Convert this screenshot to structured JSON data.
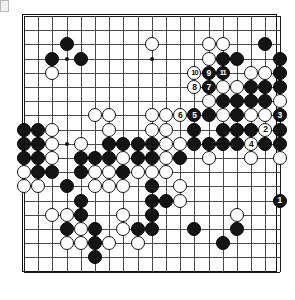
{
  "app": {
    "title": "Go Game Record Diagram",
    "board_size": 19,
    "colors": {
      "board_background": "#ffffff",
      "line": "#4a4a4a",
      "border": "#111111",
      "black_stone": "#141414",
      "white_stone": "#ffffff"
    }
  },
  "board": {
    "size": 19,
    "origin_x": 8,
    "origin_y": 8,
    "spacing": 14.2,
    "hoshi": [
      {
        "col": 4,
        "row": 4
      },
      {
        "col": 10,
        "row": 4
      },
      {
        "col": 16,
        "row": 4
      },
      {
        "col": 4,
        "row": 10
      },
      {
        "col": 10,
        "row": 10
      },
      {
        "col": 16,
        "row": 10
      },
      {
        "col": 4,
        "row": 16
      },
      {
        "col": 10,
        "row": 16
      },
      {
        "col": 16,
        "row": 16
      }
    ],
    "stones": [
      {
        "col": 4,
        "row": 3,
        "color": "black"
      },
      {
        "col": 3,
        "row": 4,
        "color": "black"
      },
      {
        "col": 5,
        "row": 4,
        "color": "black"
      },
      {
        "col": 3,
        "row": 5,
        "color": "white"
      },
      {
        "col": 10,
        "row": 3,
        "color": "white"
      },
      {
        "col": 14,
        "row": 3,
        "color": "white"
      },
      {
        "col": 15,
        "row": 3,
        "color": "white"
      },
      {
        "col": 18,
        "row": 3,
        "color": "black"
      },
      {
        "col": 14,
        "row": 4,
        "color": "white"
      },
      {
        "col": 15,
        "row": 4,
        "color": "black"
      },
      {
        "col": 16,
        "row": 4,
        "color": "black"
      },
      {
        "col": 19,
        "row": 4,
        "color": "black"
      },
      {
        "col": 13,
        "row": 5,
        "color": "white",
        "label": "10"
      },
      {
        "col": 14,
        "row": 5,
        "color": "black",
        "label": "9"
      },
      {
        "col": 15,
        "row": 5,
        "color": "black",
        "label": "11"
      },
      {
        "col": 17,
        "row": 5,
        "color": "white"
      },
      {
        "col": 18,
        "row": 5,
        "color": "white"
      },
      {
        "col": 19,
        "row": 5,
        "color": "black"
      },
      {
        "col": 13,
        "row": 6,
        "color": "white",
        "label": "8"
      },
      {
        "col": 14,
        "row": 6,
        "color": "black",
        "label": "7"
      },
      {
        "col": 15,
        "row": 6,
        "color": "white"
      },
      {
        "col": 16,
        "row": 6,
        "color": "white"
      },
      {
        "col": 17,
        "row": 6,
        "color": "black"
      },
      {
        "col": 18,
        "row": 6,
        "color": "black"
      },
      {
        "col": 19,
        "row": 6,
        "color": "black"
      },
      {
        "col": 14,
        "row": 7,
        "color": "white"
      },
      {
        "col": 15,
        "row": 7,
        "color": "black"
      },
      {
        "col": 16,
        "row": 7,
        "color": "black"
      },
      {
        "col": 17,
        "row": 7,
        "color": "black"
      },
      {
        "col": 18,
        "row": 7,
        "color": "black"
      },
      {
        "col": 19,
        "row": 7,
        "color": "white"
      },
      {
        "col": 6,
        "row": 8,
        "color": "white"
      },
      {
        "col": 7,
        "row": 8,
        "color": "white"
      },
      {
        "col": 10,
        "row": 8,
        "color": "white"
      },
      {
        "col": 11,
        "row": 8,
        "color": "white"
      },
      {
        "col": 12,
        "row": 8,
        "color": "white",
        "label": "6"
      },
      {
        "col": 13,
        "row": 8,
        "color": "black",
        "label": "5"
      },
      {
        "col": 14,
        "row": 8,
        "color": "black"
      },
      {
        "col": 15,
        "row": 8,
        "color": "white"
      },
      {
        "col": 16,
        "row": 8,
        "color": "black"
      },
      {
        "col": 17,
        "row": 8,
        "color": "white"
      },
      {
        "col": 18,
        "row": 8,
        "color": "white"
      },
      {
        "col": 19,
        "row": 8,
        "color": "black",
        "label": "3"
      },
      {
        "col": 1,
        "row": 9,
        "color": "black"
      },
      {
        "col": 2,
        "row": 9,
        "color": "black"
      },
      {
        "col": 3,
        "row": 9,
        "color": "white"
      },
      {
        "col": 7,
        "row": 9,
        "color": "white"
      },
      {
        "col": 10,
        "row": 9,
        "color": "white"
      },
      {
        "col": 11,
        "row": 9,
        "color": "white"
      },
      {
        "col": 13,
        "row": 9,
        "color": "black"
      },
      {
        "col": 15,
        "row": 9,
        "color": "black"
      },
      {
        "col": 16,
        "row": 9,
        "color": "black"
      },
      {
        "col": 17,
        "row": 9,
        "color": "black"
      },
      {
        "col": 18,
        "row": 9,
        "color": "white",
        "label": "2"
      },
      {
        "col": 19,
        "row": 9,
        "color": "black"
      },
      {
        "col": 1,
        "row": 10,
        "color": "black"
      },
      {
        "col": 2,
        "row": 10,
        "color": "black"
      },
      {
        "col": 3,
        "row": 10,
        "color": "white"
      },
      {
        "col": 5,
        "row": 10,
        "color": "white"
      },
      {
        "col": 7,
        "row": 10,
        "color": "black"
      },
      {
        "col": 8,
        "row": 10,
        "color": "black"
      },
      {
        "col": 9,
        "row": 10,
        "color": "black"
      },
      {
        "col": 10,
        "row": 10,
        "color": "black"
      },
      {
        "col": 11,
        "row": 10,
        "color": "white"
      },
      {
        "col": 12,
        "row": 10,
        "color": "white"
      },
      {
        "col": 13,
        "row": 10,
        "color": "black"
      },
      {
        "col": 14,
        "row": 10,
        "color": "black"
      },
      {
        "col": 15,
        "row": 10,
        "color": "black"
      },
      {
        "col": 16,
        "row": 10,
        "color": "black"
      },
      {
        "col": 17,
        "row": 10,
        "color": "white",
        "label": "4"
      },
      {
        "col": 18,
        "row": 10,
        "color": "black"
      },
      {
        "col": 19,
        "row": 10,
        "color": "black"
      },
      {
        "col": 1,
        "row": 11,
        "color": "black"
      },
      {
        "col": 2,
        "row": 11,
        "color": "black"
      },
      {
        "col": 3,
        "row": 11,
        "color": "white"
      },
      {
        "col": 5,
        "row": 11,
        "color": "black"
      },
      {
        "col": 6,
        "row": 11,
        "color": "black"
      },
      {
        "col": 7,
        "row": 11,
        "color": "black"
      },
      {
        "col": 8,
        "row": 11,
        "color": "white"
      },
      {
        "col": 9,
        "row": 11,
        "color": "black"
      },
      {
        "col": 10,
        "row": 11,
        "color": "black"
      },
      {
        "col": 11,
        "row": 11,
        "color": "white"
      },
      {
        "col": 12,
        "row": 11,
        "color": "black"
      },
      {
        "col": 14,
        "row": 11,
        "color": "white"
      },
      {
        "col": 17,
        "row": 11,
        "color": "white"
      },
      {
        "col": 19,
        "row": 11,
        "color": "white"
      },
      {
        "col": 1,
        "row": 12,
        "color": "white"
      },
      {
        "col": 2,
        "row": 12,
        "color": "black"
      },
      {
        "col": 3,
        "row": 12,
        "color": "black"
      },
      {
        "col": 5,
        "row": 12,
        "color": "black"
      },
      {
        "col": 6,
        "row": 12,
        "color": "white"
      },
      {
        "col": 7,
        "row": 12,
        "color": "white"
      },
      {
        "col": 8,
        "row": 12,
        "color": "black"
      },
      {
        "col": 9,
        "row": 12,
        "color": "white"
      },
      {
        "col": 10,
        "row": 12,
        "color": "white"
      },
      {
        "col": 11,
        "row": 12,
        "color": "white"
      },
      {
        "col": 1,
        "row": 13,
        "color": "white"
      },
      {
        "col": 2,
        "row": 13,
        "color": "white"
      },
      {
        "col": 4,
        "row": 13,
        "color": "black"
      },
      {
        "col": 6,
        "row": 13,
        "color": "white"
      },
      {
        "col": 7,
        "row": 13,
        "color": "white"
      },
      {
        "col": 8,
        "row": 13,
        "color": "white"
      },
      {
        "col": 10,
        "row": 13,
        "color": "black"
      },
      {
        "col": 12,
        "row": 13,
        "color": "white"
      },
      {
        "col": 5,
        "row": 14,
        "color": "black"
      },
      {
        "col": 10,
        "row": 14,
        "color": "black"
      },
      {
        "col": 11,
        "row": 14,
        "color": "black"
      },
      {
        "col": 12,
        "row": 14,
        "color": "white"
      },
      {
        "col": 19,
        "row": 14,
        "color": "black",
        "label": "1"
      },
      {
        "col": 3,
        "row": 15,
        "color": "white"
      },
      {
        "col": 4,
        "row": 15,
        "color": "white"
      },
      {
        "col": 5,
        "row": 15,
        "color": "black"
      },
      {
        "col": 8,
        "row": 15,
        "color": "white"
      },
      {
        "col": 10,
        "row": 15,
        "color": "black"
      },
      {
        "col": 16,
        "row": 15,
        "color": "white"
      },
      {
        "col": 4,
        "row": 16,
        "color": "black"
      },
      {
        "col": 5,
        "row": 16,
        "color": "white"
      },
      {
        "col": 6,
        "row": 16,
        "color": "black"
      },
      {
        "col": 8,
        "row": 16,
        "color": "white"
      },
      {
        "col": 9,
        "row": 16,
        "color": "black"
      },
      {
        "col": 10,
        "row": 16,
        "color": "black"
      },
      {
        "col": 13,
        "row": 16,
        "color": "black"
      },
      {
        "col": 16,
        "row": 16,
        "color": "black"
      },
      {
        "col": 4,
        "row": 17,
        "color": "white"
      },
      {
        "col": 5,
        "row": 17,
        "color": "white"
      },
      {
        "col": 6,
        "row": 17,
        "color": "black"
      },
      {
        "col": 7,
        "row": 17,
        "color": "white"
      },
      {
        "col": 9,
        "row": 17,
        "color": "white"
      },
      {
        "col": 15,
        "row": 17,
        "color": "black"
      },
      {
        "col": 6,
        "row": 18,
        "color": "black"
      }
    ]
  },
  "legend": {
    "move_numbers": [
      "1",
      "2",
      "3",
      "4",
      "5",
      "6",
      "7",
      "8",
      "9",
      "10",
      "11"
    ],
    "black_moves": [
      "1",
      "3",
      "5",
      "7",
      "9",
      "11"
    ],
    "white_moves": [
      "2",
      "4",
      "6",
      "8",
      "10"
    ]
  }
}
